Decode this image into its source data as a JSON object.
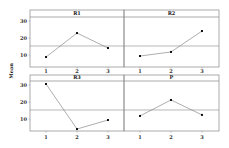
{
  "chart_data": {
    "type": "line",
    "title": "",
    "ylabel": "Mean",
    "xlabel": "",
    "layout": "2x2 panel grid, shared y-axis per row",
    "categories": [
      "1",
      "2",
      "3"
    ],
    "yticks": [
      10,
      20,
      30
    ],
    "ylim": [
      3,
      34
    ],
    "grid": false,
    "reference_line": 15.3,
    "panels": [
      {
        "name": "R1",
        "values": [
          8.8,
          22.9,
          14.1
        ]
      },
      {
        "name": "R2",
        "values": [
          9.4,
          11.8,
          24.1
        ]
      },
      {
        "name": "R3",
        "values": [
          30.6,
          4.1,
          9.4
        ]
      },
      {
        "name": "P",
        "values": [
          11.8,
          21.2,
          12.4
        ]
      }
    ]
  },
  "colors": {
    "frame": "#888888",
    "line": "#777777",
    "point": "#111111",
    "reference": "#888888",
    "background": "#ffffff"
  }
}
